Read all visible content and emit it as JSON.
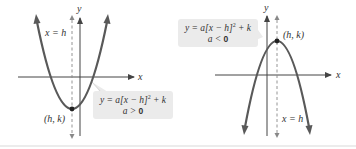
{
  "colors": {
    "curve": "#595959",
    "axis": "#444444",
    "dashed": "#888888",
    "box_fill": "#ebebeb",
    "text": "#333333",
    "separator": "#e6e6e6"
  },
  "left_graph": {
    "axis_x_label": "x",
    "axis_y_label": "y",
    "axis_of_symmetry_label": "x = h",
    "vertex_label": "(h, k)",
    "equation_line1_prefix": "y = a[x − h]",
    "equation_exponent": "2",
    "equation_line1_suffix": " + k",
    "condition_prefix": "a > ",
    "condition_value": "0",
    "opens": "up"
  },
  "right_graph": {
    "axis_x_label": "x",
    "axis_y_label": "y",
    "axis_of_symmetry_label": "x = h",
    "vertex_label": "(h, k)",
    "equation_line1_prefix": "y = a[x − h]",
    "equation_exponent": "2",
    "equation_line1_suffix": " + k",
    "condition_prefix": "a < ",
    "condition_value": "0",
    "opens": "down"
  }
}
